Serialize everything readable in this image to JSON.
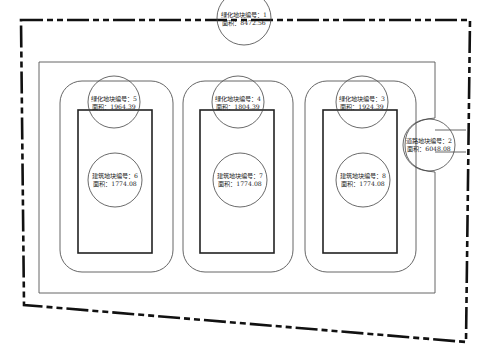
{
  "diagram": {
    "type": "site-plan",
    "colors": {
      "stroke": "#222222",
      "thin_stroke": "#555555",
      "background": "#ffffff"
    },
    "site_boundary": {
      "style": "dash-dot thick",
      "points": [
        [
          21,
          20
        ],
        [
          470,
          20
        ],
        [
          466,
          342
        ],
        [
          24,
          305
        ]
      ]
    },
    "greening_parcel": {
      "label": "绿化地块编号：1",
      "area_label": "面积：8472.56",
      "circle": {
        "cx": 244,
        "cy": 18,
        "r": 27
      }
    },
    "road_parcel": {
      "label": "道路地块编号：2",
      "area_label": "面积：6048.08",
      "circle": {
        "cx": 429,
        "cy": 145,
        "r": 26
      }
    },
    "inner_road_rect": {
      "x": 39,
      "y": 62,
      "w": 396,
      "h": 231
    },
    "blocks": [
      {
        "green": {
          "label": "绿化地块编号：5",
          "area_label": "面积：1964.39",
          "circle": {
            "cx": 114,
            "cy": 102,
            "r": 26
          }
        },
        "building": {
          "label": "建筑地块编号：6",
          "area_label": "面积：1774.08",
          "circle": {
            "cx": 115,
            "cy": 180,
            "r": 27
          }
        },
        "rounded_rect": {
          "x": 60,
          "y": 81,
          "w": 113,
          "h": 191,
          "rx": 22
        },
        "building_rect": {
          "x": 78,
          "y": 110,
          "w": 74,
          "h": 143
        }
      },
      {
        "green": {
          "label": "绿化地块编号：4",
          "area_label": "面积：1804.39",
          "circle": {
            "cx": 238,
            "cy": 102,
            "r": 26
          }
        },
        "building": {
          "label": "建筑地块编号：7",
          "area_label": "面积：1774.08",
          "circle": {
            "cx": 240,
            "cy": 180,
            "r": 27
          }
        },
        "rounded_rect": {
          "x": 183,
          "y": 81,
          "w": 110,
          "h": 191,
          "rx": 22
        },
        "building_rect": {
          "x": 200,
          "y": 110,
          "w": 74,
          "h": 143
        }
      },
      {
        "green": {
          "label": "绿化地块编号：3",
          "area_label": "面积：1924.39",
          "circle": {
            "cx": 362,
            "cy": 102,
            "r": 26
          }
        },
        "building": {
          "label": "建筑地块编号：8",
          "area_label": "面积：1774.08",
          "circle": {
            "cx": 363,
            "cy": 180,
            "r": 27
          }
        },
        "rounded_rect": {
          "x": 305,
          "y": 81,
          "w": 111,
          "h": 191,
          "rx": 22
        },
        "building_rect": {
          "x": 323,
          "y": 110,
          "w": 74,
          "h": 143
        }
      }
    ]
  }
}
